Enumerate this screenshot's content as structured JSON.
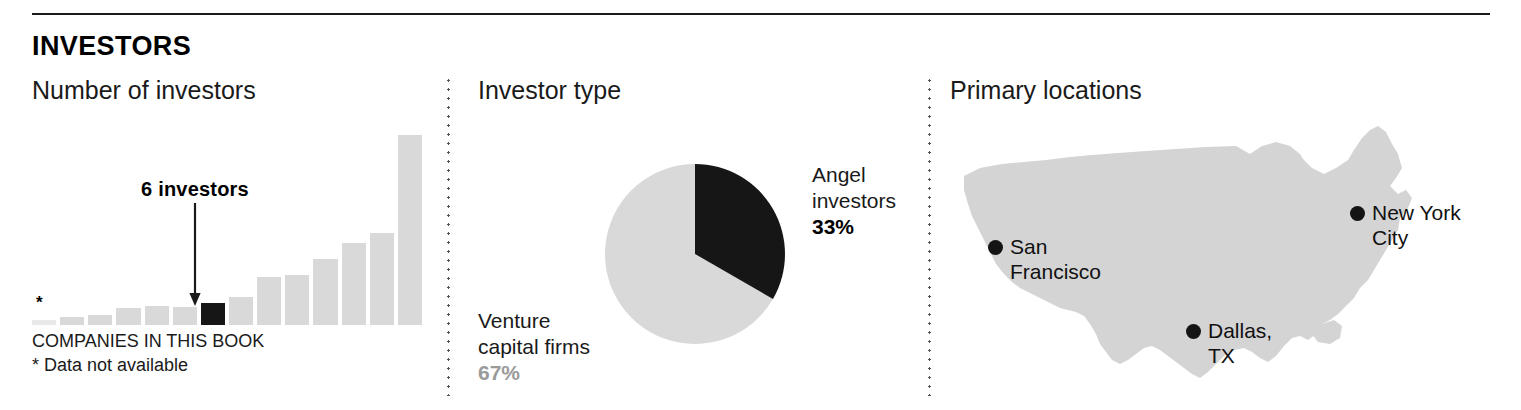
{
  "header": {
    "section_title": "INVESTORS"
  },
  "panels": {
    "bar": {
      "title": "Number of investors",
      "callout_label": "6 investors",
      "asterisk": "*",
      "caption": "COMPANIES IN THIS BOOK",
      "footnote": "* Data not available"
    },
    "pie": {
      "title": "Investor type",
      "angel_name_line1": "Angel",
      "angel_name_line2": "investors",
      "angel_pct": "33%",
      "vc_name_line1": "Venture",
      "vc_name_line2": "capital firms",
      "vc_pct": "67%"
    },
    "map": {
      "title": "Primary locations",
      "locations": [
        {
          "id": "san-francisco",
          "line1": "San",
          "line2": "Francisco"
        },
        {
          "id": "new-york-city",
          "line1": "New York",
          "line2": "City"
        },
        {
          "id": "dallas-tx",
          "line1": "Dallas,",
          "line2": "TX"
        }
      ]
    }
  },
  "colors": {
    "bar_gray": "#d9d9d9",
    "bar_highlight": "#161616",
    "pie_dark": "#161616",
    "pie_light": "#d9d9d9",
    "map_fill": "#d4d4d4",
    "rule": "#1a1a1a",
    "pct_light_text": "#9a9a9a"
  },
  "chart_data": [
    {
      "type": "bar",
      "title": "Number of investors",
      "xlabel": "COMPANIES IN THIS BOOK",
      "ylabel": "",
      "grid": false,
      "legend": "none",
      "note": "* Data not available",
      "annotation": {
        "label": "6 investors",
        "category_index": 6,
        "value": 6
      },
      "categories": [
        "*",
        "2",
        "3",
        "4",
        "5",
        "6",
        "7",
        "8",
        "9",
        "10",
        "11",
        "12",
        "13",
        "14"
      ],
      "values": [
        0,
        2,
        3,
        5,
        6,
        5,
        6,
        9,
        14,
        15,
        20,
        26,
        29,
        32,
        58
      ],
      "bars": [
        {
          "index": 0,
          "height_px": 5,
          "value": 0,
          "highlighted": false,
          "no_data": true
        },
        {
          "index": 1,
          "height_px": 8,
          "value": 1,
          "highlighted": false,
          "no_data": false
        },
        {
          "index": 2,
          "height_px": 10,
          "value": 1,
          "highlighted": false,
          "no_data": false
        },
        {
          "index": 3,
          "height_px": 17,
          "value": 2,
          "highlighted": false,
          "no_data": false
        },
        {
          "index": 4,
          "height_px": 19,
          "value": 3,
          "highlighted": false,
          "no_data": false
        },
        {
          "index": 5,
          "height_px": 18,
          "value": 3,
          "highlighted": false,
          "no_data": false
        },
        {
          "index": 6,
          "height_px": 22,
          "value": 6,
          "highlighted": true,
          "no_data": false
        },
        {
          "index": 7,
          "height_px": 28,
          "value": 7,
          "highlighted": false,
          "no_data": false
        },
        {
          "index": 8,
          "height_px": 48,
          "value": 12,
          "highlighted": false,
          "no_data": false
        },
        {
          "index": 9,
          "height_px": 50,
          "value": 13,
          "highlighted": false,
          "no_data": false
        },
        {
          "index": 10,
          "height_px": 66,
          "value": 17,
          "highlighted": false,
          "no_data": false
        },
        {
          "index": 11,
          "height_px": 82,
          "value": 21,
          "highlighted": false,
          "no_data": false
        },
        {
          "index": 12,
          "height_px": 92,
          "value": 24,
          "highlighted": false,
          "no_data": false
        },
        {
          "index": 13,
          "height_px": 190,
          "value": 50,
          "highlighted": false,
          "no_data": false
        }
      ]
    },
    {
      "type": "pie",
      "title": "Investor type",
      "legend": "labels-outside",
      "slices": [
        {
          "name": "Angel investors",
          "value": 33,
          "label": "33%",
          "color": "#161616"
        },
        {
          "name": "Venture capital firms",
          "value": 67,
          "label": "67%",
          "color": "#d9d9d9"
        }
      ]
    },
    {
      "type": "map",
      "title": "Primary locations",
      "region": "United States",
      "points": [
        {
          "name": "San Francisco",
          "x_pct": 7,
          "y_pct": 43
        },
        {
          "name": "New York City",
          "x_pct": 74,
          "y_pct": 30
        },
        {
          "name": "Dallas, TX",
          "x_pct": 44,
          "y_pct": 74
        }
      ]
    }
  ]
}
